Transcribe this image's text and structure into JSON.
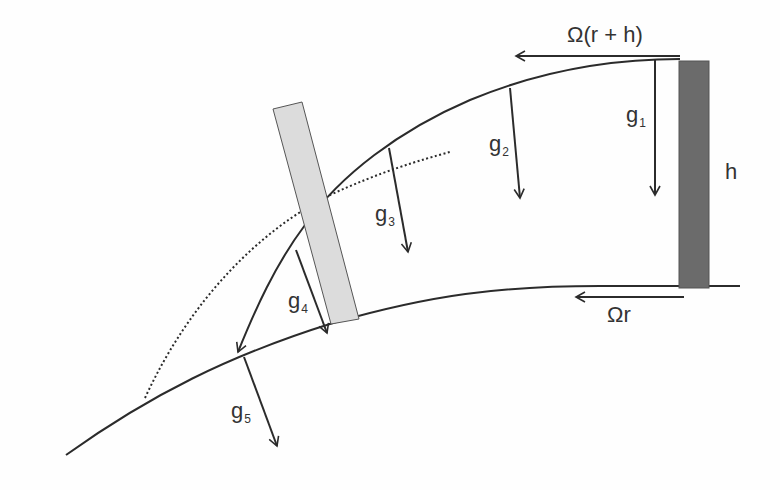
{
  "diagram": {
    "colors": {
      "line": "#2b2b2b",
      "tower_fixed": "#6b6b6b",
      "tower_rotated": "#dcdcdc",
      "background": "#fefefe"
    },
    "labels": {
      "top_velocity": "Ω(r + h)",
      "ground_velocity": "Ωr",
      "height": "h",
      "gravity_vectors": [
        {
          "base": "g",
          "sub": "1"
        },
        {
          "base": "g",
          "sub": "2"
        },
        {
          "base": "g",
          "sub": "3"
        },
        {
          "base": "g",
          "sub": "4"
        },
        {
          "base": "g",
          "sub": "5"
        }
      ]
    },
    "elements": {
      "ground_curve": "solid",
      "trajectory_curve": "solid with arrowhead",
      "reference_curve": "dotted",
      "tower_initial": "dark gray vertical rectangle",
      "tower_rotated": "light gray tilted rectangle"
    }
  }
}
